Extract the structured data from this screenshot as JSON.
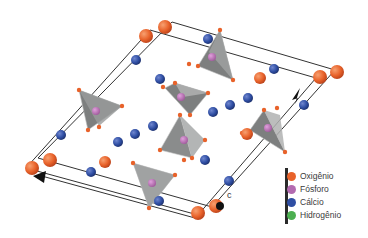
{
  "figure": {
    "title": "",
    "axis_markers": {
      "c_label": "c"
    }
  },
  "legend": {
    "items": [
      {
        "label": "Oxigênio",
        "color": "#e8622a"
      },
      {
        "label": "Fósforo",
        "color": "#b36bb0"
      },
      {
        "label": "Cálcio",
        "color": "#2f4ea3"
      },
      {
        "label": "Hidrogênio",
        "color": "#4caf50"
      }
    ]
  },
  "colors": {
    "oxygen": "#e8622a",
    "phosphorus": "#b36bb0",
    "calcium": "#2f4ea3",
    "hydrogen": "#4caf50",
    "tetrahedron": "#8a8c8c",
    "cell_line": "#333333"
  }
}
